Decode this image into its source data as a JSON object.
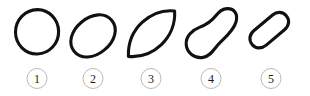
{
  "figure": {
    "caption": "",
    "background_color": "#ffffff",
    "stroke_color": "#111111",
    "label_ring_color": "#b9b9b9",
    "label_text_color": "#1a1a1a",
    "shapes": [
      {
        "label": "1",
        "name": "circle",
        "description": "hand-drawn closed circle outline",
        "center_x": 37,
        "center_y": 34,
        "width": 50,
        "height": 50,
        "rotation_deg": 0
      },
      {
        "label": "2",
        "name": "ellipse",
        "description": "hand-drawn tilted ellipse, long axis from lower-left to upper-right",
        "center_x": 92,
        "center_y": 36,
        "width": 56,
        "height": 34,
        "rotation_deg": -40
      },
      {
        "label": "3",
        "name": "lens-leaf",
        "description": "hand-drawn leaf / lens shape with sharp points at lower-left and upper-right",
        "center_x": 150,
        "center_y": 36,
        "width": 52,
        "height": 44,
        "rotation_deg": -40
      },
      {
        "label": "4",
        "name": "pear-gourd",
        "description": "hand-drawn curved pear / gourd shape, bulb at lower-left and narrow tip at upper-right",
        "center_x": 210,
        "center_y": 34,
        "width": 54,
        "height": 54,
        "rotation_deg": 0
      },
      {
        "label": "5",
        "name": "stadium-rounded-bar",
        "description": "hand-drawn rounded rectangle / stadium bar tilted about 40 degrees",
        "center_x": 270,
        "center_y": 34,
        "width": 54,
        "height": 54,
        "rotation_deg": -40
      }
    ]
  }
}
